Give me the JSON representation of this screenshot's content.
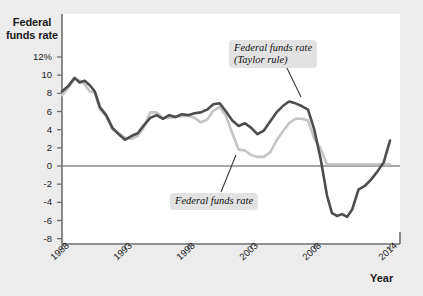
{
  "chart_data": {
    "type": "line",
    "title": "",
    "xlabel": "Year",
    "ylabel": "Federal funds rate",
    "ylim": [
      -8,
      12
    ],
    "xlim": [
      1988,
      2014
    ],
    "grid": false,
    "legend_position": "inline-annotations",
    "yticks": [
      "12%",
      "10",
      "8",
      "6",
      "4",
      "2",
      "0",
      "-2",
      "-4",
      "-6",
      "-8"
    ],
    "ytick_values": [
      12,
      10,
      8,
      6,
      4,
      2,
      0,
      -2,
      -4,
      -6,
      -8
    ],
    "xticks": [
      "1988",
      "1993",
      "1998",
      "2003",
      "2008",
      "2014"
    ],
    "xtick_values": [
      1988,
      1993,
      1998,
      2003,
      2008,
      2014
    ],
    "zero_line": 0,
    "series": [
      {
        "name": "Federal funds rate",
        "color": "#c4c4c4",
        "x": [
          1988.0,
          1988.5,
          1989.0,
          1989.4,
          1989.8,
          1990.2,
          1990.6,
          1991.0,
          1991.5,
          1992.0,
          1992.5,
          1993.0,
          1993.5,
          1994.0,
          1994.5,
          1995.0,
          1995.5,
          1996.0,
          1996.5,
          1997.0,
          1997.5,
          1998.0,
          1998.5,
          1999.0,
          1999.5,
          2000.0,
          2000.5,
          2001.0,
          2001.5,
          2002.0,
          2002.5,
          2003.0,
          2003.5,
          2004.0,
          2004.5,
          2005.0,
          2005.5,
          2006.0,
          2006.5,
          2007.0,
          2007.5,
          2008.0,
          2008.5,
          2009.0,
          2009.5,
          2010.0,
          2011.0,
          2012.0,
          2013.0,
          2014.0
        ],
        "values": [
          7.8,
          8.6,
          9.6,
          9.4,
          9.0,
          8.2,
          8.1,
          6.2,
          5.5,
          4.0,
          3.6,
          3.1,
          3.0,
          3.3,
          4.3,
          5.9,
          5.9,
          5.3,
          5.3,
          5.4,
          5.5,
          5.5,
          5.3,
          4.8,
          5.1,
          6.1,
          6.5,
          5.5,
          3.6,
          1.8,
          1.7,
          1.2,
          1.0,
          1.0,
          1.5,
          2.8,
          3.8,
          4.7,
          5.2,
          5.2,
          5.0,
          3.0,
          1.9,
          0.2,
          0.2,
          0.2,
          0.2,
          0.2,
          0.2,
          0.2
        ]
      },
      {
        "name": "Federal funds rate (Taylor rule)",
        "color": "#4d4d4d",
        "x": [
          1988.0,
          1988.5,
          1989.0,
          1989.4,
          1989.8,
          1990.2,
          1990.6,
          1991.0,
          1991.5,
          1992.0,
          1992.5,
          1993.0,
          1993.5,
          1994.0,
          1994.5,
          1995.0,
          1995.5,
          1996.0,
          1996.5,
          1997.0,
          1997.5,
          1998.0,
          1998.5,
          1999.0,
          1999.5,
          2000.0,
          2000.5,
          2001.0,
          2001.5,
          2002.0,
          2002.5,
          2003.0,
          2003.5,
          2004.0,
          2004.5,
          2005.0,
          2005.5,
          2006.0,
          2006.5,
          2007.0,
          2007.5,
          2008.0,
          2008.5,
          2009.0,
          2009.4,
          2009.8,
          2010.2,
          2010.6,
          2011.0,
          2011.5,
          2012.0,
          2012.5,
          2013.0,
          2013.5,
          2014.0
        ],
        "values": [
          8.2,
          8.8,
          9.7,
          9.2,
          9.4,
          8.9,
          8.2,
          6.5,
          5.6,
          4.2,
          3.5,
          2.9,
          3.3,
          3.6,
          4.5,
          5.3,
          5.6,
          5.2,
          5.6,
          5.4,
          5.7,
          5.6,
          5.8,
          5.9,
          6.2,
          6.8,
          6.9,
          6.0,
          5.0,
          4.4,
          4.7,
          4.2,
          3.5,
          3.9,
          4.9,
          5.9,
          6.6,
          7.1,
          6.9,
          6.6,
          6.2,
          4.0,
          0.8,
          -3.2,
          -5.2,
          -5.5,
          -5.3,
          -5.6,
          -4.8,
          -2.6,
          -2.2,
          -1.5,
          -0.6,
          0.4,
          2.8
        ]
      }
    ],
    "annotations": [
      {
        "name": "taylor-rule-callout",
        "text": "Federal funds rate\n(Taylor rule)",
        "points_to_x": 2007.1,
        "points_to_y": 6.6
      },
      {
        "name": "actual-rate-callout",
        "text": "Federal funds rate",
        "points_to_x": 2001.7,
        "points_to_y": 3.2
      }
    ]
  },
  "axes": {
    "y_title": "Federal\nfunds rate",
    "x_title": "Year"
  }
}
